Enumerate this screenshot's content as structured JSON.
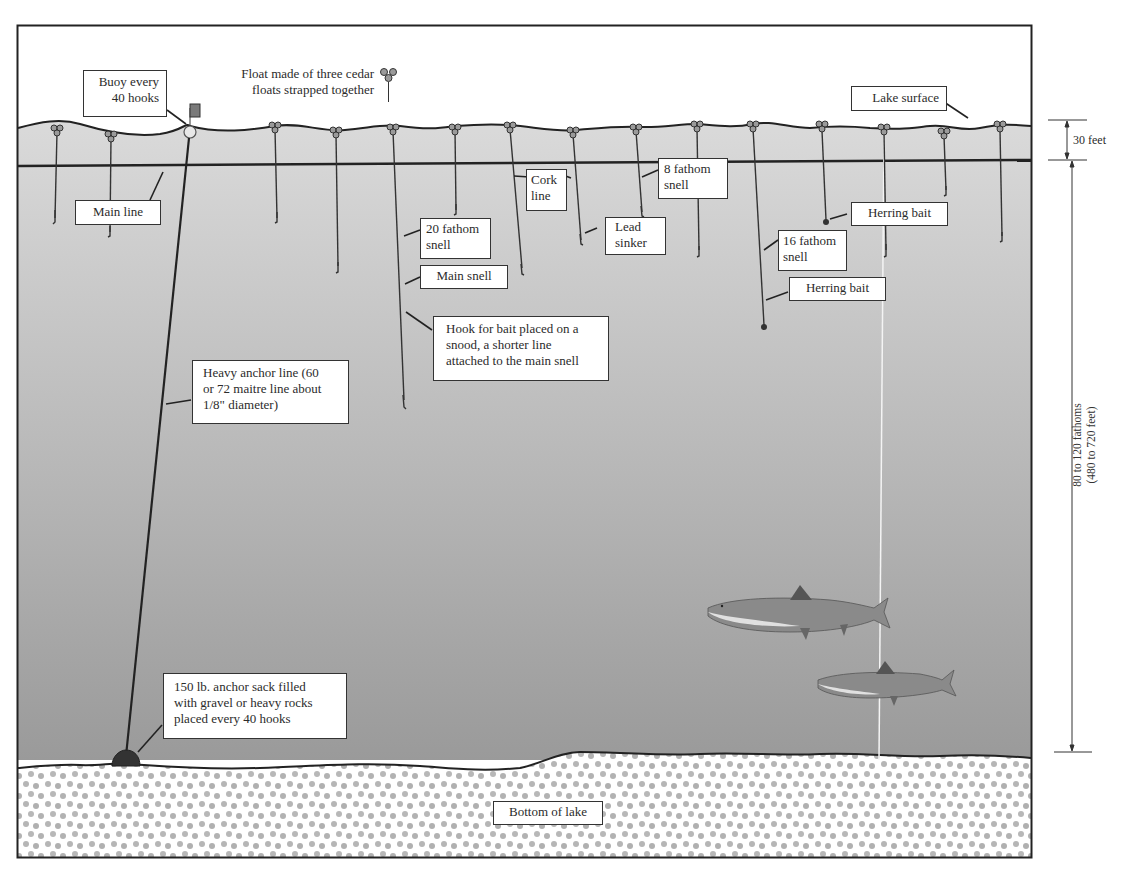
{
  "diagram": {
    "type": "longline fishing rig cross-section",
    "colors": {
      "frame": "#2b2b2b",
      "water_top": "#dcdcdc",
      "water_bottom": "#9c9c9c",
      "lake_bed_dots": "#b4b4b4",
      "buoy_flag": "#7a7a7a"
    },
    "legend": {
      "float_label_line1": "Float made of three cedar",
      "float_label_line2": "floats strapped together",
      "icon": "triple-cedar-float-icon"
    },
    "labels": {
      "buoy": [
        "Buoy every",
        "40 hooks"
      ],
      "main_line": [
        "Main line"
      ],
      "lake_surface": [
        "Lake surface"
      ],
      "cork_line": [
        "Cork",
        "line"
      ],
      "eight_fathom": [
        "8 fathom",
        "snell"
      ],
      "twenty_fathom": [
        "20 fathom",
        "snell"
      ],
      "main_snell": [
        "Main snell"
      ],
      "lead_sinker": [
        "Lead",
        "sinker"
      ],
      "sixteen_fathom": [
        "16 fathom",
        "snell"
      ],
      "herring_bait_1": [
        "Herring bait"
      ],
      "herring_bait_2": [
        "Herring bait"
      ],
      "hook_snood": [
        "Hook for bait placed on a",
        "snood, a shorter line",
        "attached to the main snell"
      ],
      "anchor_line": [
        "Heavy anchor line (60",
        "or 72 maitre line about",
        "1/8\" diameter)"
      ],
      "anchor_sack": [
        "150 lb. anchor sack filled",
        "with gravel or heavy rocks",
        "placed every 40 hooks"
      ],
      "bottom": [
        "Bottom of lake"
      ]
    },
    "dimensions": {
      "surface_depth": "30 feet",
      "total_depth_line1": "80 to 120 fathoms",
      "total_depth_line2": "(480 to 720 feet)"
    },
    "floats_x": [
      57,
      111,
      275,
      336,
      393,
      455,
      510,
      573,
      636,
      697,
      753,
      822,
      884,
      944,
      1000
    ],
    "hook_depths": [
      222,
      235,
      222,
      270,
      405,
      213,
      272,
      243,
      215,
      255,
      330,
      222,
      254,
      193,
      240
    ]
  }
}
